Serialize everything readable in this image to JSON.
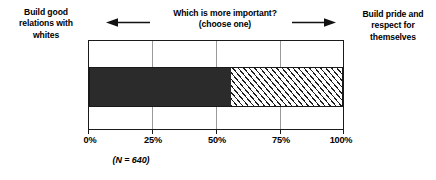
{
  "labels": {
    "left": "Build good relations with whites",
    "right": "Build pride and respect for themselves"
  },
  "prompt": {
    "line1": "Which is more important?",
    "line2": "(choose one)"
  },
  "icons": {
    "arrow_left": "arrow-left-icon",
    "arrow_right": "arrow-right-icon"
  },
  "note": "(N = 640)",
  "chart_data": {
    "type": "bar",
    "orientation": "horizontal",
    "stacked": true,
    "title": "Which is more important?",
    "subtitle": "(choose one)",
    "xlabel": "",
    "ylabel": "",
    "xlim": [
      0,
      100
    ],
    "grid": true,
    "legend": "none",
    "tick_labels": [
      "0%",
      "25%",
      "50%",
      "75%",
      "100%"
    ],
    "tick_values": [
      0,
      25,
      50,
      75,
      100
    ],
    "sample_size": 640,
    "sample_size_label": "(N = 640)",
    "categories": [
      "All respondents"
    ],
    "series": [
      {
        "name": "Build good relations with whites",
        "values": [
          56
        ],
        "fill": "solid",
        "color": "#2b2b2b"
      },
      {
        "name": "Build pride and respect for themselves",
        "values": [
          44
        ],
        "fill": "diagonal-hatch",
        "color": "#ffffff"
      }
    ]
  }
}
